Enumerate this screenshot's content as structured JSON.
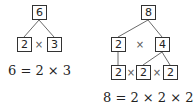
{
  "tree_6": {
    "root": "6",
    "left": "2",
    "op": "×",
    "right": "3",
    "equation": "6 = 2 × 3"
  },
  "tree_8": {
    "root": "8",
    "mid_left": "2",
    "mid_op": "×",
    "mid_right": "4",
    "bottom": [
      "2",
      "2",
      "2"
    ],
    "bottom_ops": [
      "×",
      "×"
    ],
    "equation": "8 = 2 × 2 × 2"
  }
}
